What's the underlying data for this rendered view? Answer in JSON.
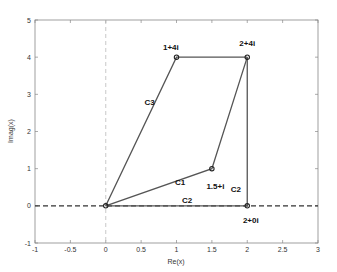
{
  "chart_data": {
    "type": "line",
    "title": "",
    "xlabel": "Re(x)",
    "ylabel": "Imag(x)",
    "xlim": [
      -1,
      3
    ],
    "ylim": [
      -1,
      5
    ],
    "xticks": [
      -1,
      -0.5,
      0,
      0.5,
      1,
      1.5,
      2,
      2.5,
      3
    ],
    "xtick_labels": [
      "-1",
      "-0.5",
      "0",
      "0.5",
      "1",
      "1.5",
      "2",
      "2.5",
      "3"
    ],
    "yticks": [
      -1,
      0,
      1,
      2,
      3,
      4,
      5
    ],
    "ytick_labels": [
      "-1",
      "0",
      "1",
      "2",
      "3",
      "4",
      "5"
    ],
    "grid": false,
    "legend": null,
    "reference_lines": [
      {
        "name": "real-axis",
        "orientation": "horizontal",
        "value": 0,
        "style": "dashed",
        "color": "#333333"
      },
      {
        "name": "imag-axis",
        "orientation": "vertical",
        "value": 0,
        "style": "dashed",
        "color": "#bbbbbb"
      }
    ],
    "series": [
      {
        "name": "C1",
        "points": [
          [
            0,
            0
          ],
          [
            1.5,
            1
          ],
          [
            2,
            4
          ]
        ],
        "color": "#555555"
      },
      {
        "name": "C2",
        "points": [
          [
            0,
            0
          ],
          [
            2,
            0
          ],
          [
            2,
            4
          ]
        ],
        "color": "#555555"
      },
      {
        "name": "C3",
        "points": [
          [
            0,
            0
          ],
          [
            1,
            4
          ],
          [
            2,
            4
          ]
        ],
        "color": "#555555"
      }
    ],
    "markers": [
      {
        "x": 0,
        "y": 0,
        "label": ""
      },
      {
        "x": 1.5,
        "y": 1,
        "label": "1.5+i"
      },
      {
        "x": 2,
        "y": 4,
        "label": "2+4i"
      },
      {
        "x": 1,
        "y": 4,
        "label": "1+4i"
      },
      {
        "x": 2,
        "y": 0,
        "label": "2+0i"
      }
    ],
    "annotations": [
      {
        "text": "C1",
        "x": 1.05,
        "y": 0.55
      },
      {
        "text": "C2",
        "x": 1.15,
        "y": 0.08
      },
      {
        "text": "C2",
        "x": 1.84,
        "y": 0.38
      },
      {
        "text": "C3",
        "x": 0.62,
        "y": 2.7
      },
      {
        "text": "1+4i",
        "x": 0.92,
        "y": 4.2
      },
      {
        "text": "2+4i",
        "x": 2.0,
        "y": 4.3
      },
      {
        "text": "1.5+i",
        "x": 1.55,
        "y": 0.45
      },
      {
        "text": "2+0i",
        "x": 2.05,
        "y": -0.45
      }
    ]
  }
}
